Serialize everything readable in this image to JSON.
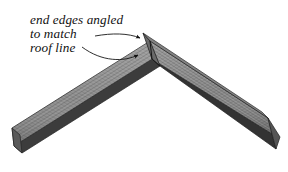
{
  "figure": {
    "background_color": "#ffffff",
    "annotation": {
      "name": "end-edges-callout",
      "lines": [
        "end edges angled",
        "to match",
        "roof line"
      ],
      "line1": "end edges angled",
      "line2": "to match",
      "line3": "roof line",
      "text_color": "#111111",
      "style": "italic serif"
    },
    "leaders": [
      {
        "name": "leader-to-top-end-edge",
        "target": "angled end edge at apex top",
        "arrowhead": "solid triangle"
      },
      {
        "name": "leader-to-inner-corner",
        "target": "inner corner of mitered joint",
        "arrowhead": "solid triangle"
      }
    ],
    "parts": [
      {
        "name": "left-board",
        "label": "left roof board",
        "face_color": "#8c8c8c",
        "edge_color": "#3a3a3a",
        "grain": "lengthwise striations"
      },
      {
        "name": "right-board",
        "label": "right roof board",
        "face_color": "#8a8a8a",
        "edge_color": "#343434",
        "grain": "lengthwise striations"
      }
    ],
    "colors": {
      "board_light": "#9a9a9a",
      "board_mid": "#8a8a8a",
      "board_dark": "#6f6f6f",
      "edge_dark": "#3a3a3a",
      "outline": "#2b2b2b",
      "ink": "#111111"
    }
  }
}
